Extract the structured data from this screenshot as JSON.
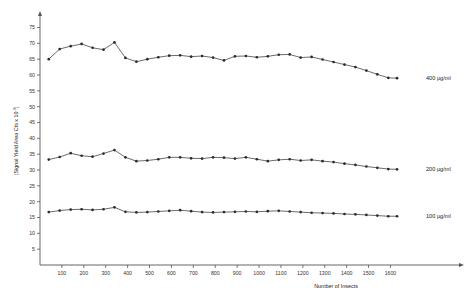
{
  "chart_data": {
    "type": "line",
    "title": "",
    "xlabel": "Number of Insects",
    "ylabel": "[Signal Yield  Area Cts x 10^-3]",
    "ylabel_display": "[Signal Yield  Area Cts x 10",
    "ylabel_exp": "-3",
    "ylabel_close": "]",
    "xlim": [
      0,
      1680
    ],
    "ylim": [
      0,
      78
    ],
    "grid": false,
    "legend_position": "right-inline",
    "yticks": [
      5,
      10,
      15,
      20,
      25,
      30,
      35,
      40,
      45,
      50,
      55,
      60,
      65,
      70,
      75
    ],
    "xticks": [
      100,
      200,
      300,
      400,
      500,
      600,
      700,
      800,
      900,
      1000,
      1100,
      1200,
      1300,
      1400,
      1500,
      1600
    ],
    "x": [
      40,
      90,
      140,
      190,
      240,
      290,
      340,
      390,
      440,
      490,
      540,
      590,
      640,
      690,
      740,
      790,
      840,
      890,
      940,
      990,
      1040,
      1090,
      1140,
      1190,
      1240,
      1290,
      1340,
      1390,
      1440,
      1490,
      1540,
      1590,
      1630
    ],
    "series": [
      {
        "name": "400 µg/ml",
        "label": "400 µg/ml",
        "color": "#2b2b2b",
        "values": [
          65.0,
          68.2,
          69.1,
          69.8,
          68.6,
          68.0,
          70.3,
          65.4,
          64.2,
          65.0,
          65.6,
          66.1,
          66.2,
          65.8,
          66.0,
          65.5,
          64.6,
          65.9,
          66.0,
          65.6,
          65.9,
          66.4,
          66.5,
          65.5,
          65.7,
          64.9,
          64.1,
          63.3,
          62.5,
          61.4,
          60.2,
          59.1,
          59.0
        ]
      },
      {
        "name": "200 µg/ml",
        "label": "200 µg/ml",
        "color": "#2b2b2b",
        "values": [
          33.3,
          34.1,
          35.3,
          34.5,
          34.2,
          35.2,
          36.3,
          34.0,
          32.8,
          33.0,
          33.4,
          34.0,
          34.0,
          33.7,
          33.6,
          34.0,
          33.9,
          33.6,
          34.0,
          33.4,
          32.8,
          33.2,
          33.4,
          33.0,
          33.2,
          32.8,
          32.5,
          32.0,
          31.6,
          31.1,
          30.7,
          30.3,
          30.2
        ]
      },
      {
        "name": "100 µg/ml",
        "label": "100 µg/ml",
        "color": "#2b2b2b",
        "values": [
          16.7,
          17.2,
          17.5,
          17.6,
          17.4,
          17.6,
          18.2,
          16.8,
          16.6,
          16.7,
          16.9,
          17.1,
          17.3,
          17.0,
          16.7,
          16.6,
          16.7,
          16.8,
          16.9,
          16.8,
          17.0,
          17.1,
          16.9,
          16.7,
          16.5,
          16.4,
          16.3,
          16.1,
          16.0,
          15.8,
          15.6,
          15.4,
          15.4
        ]
      }
    ]
  }
}
